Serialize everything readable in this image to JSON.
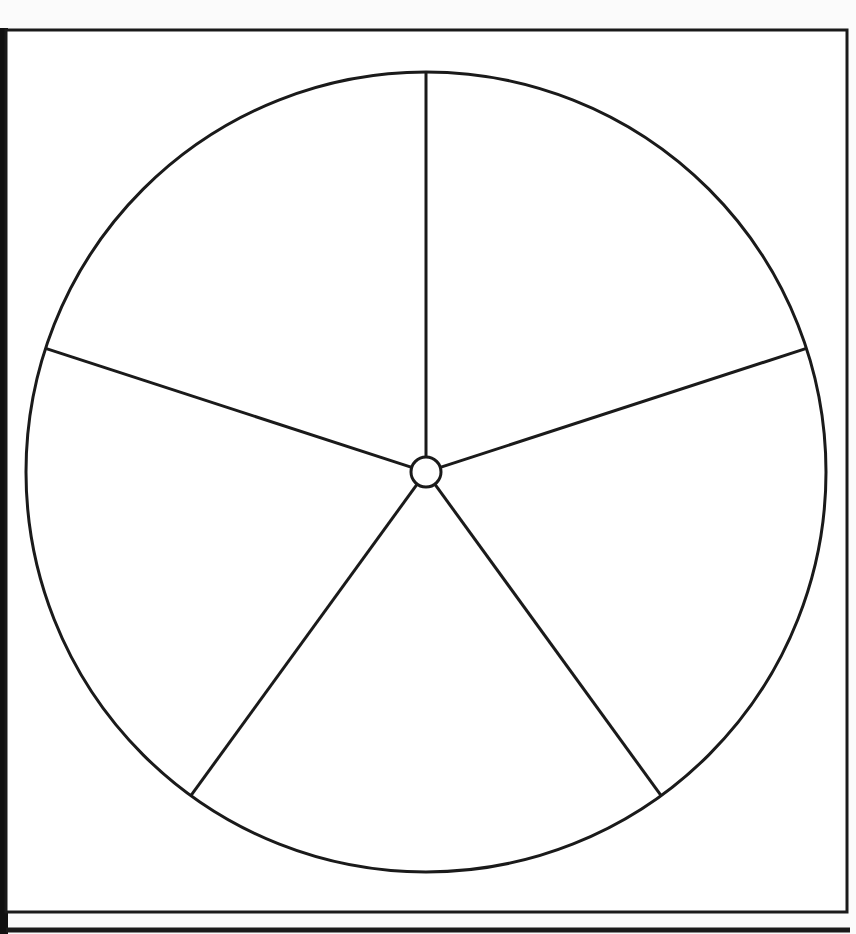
{
  "diagram": {
    "type": "segmented-circle",
    "segments": 5,
    "stroke_color": "#1a1a1a",
    "background": "#ffffff",
    "center": {
      "x": 426,
      "y": 472
    },
    "outer_radius": 400,
    "hub_radius": 15,
    "spoke_angles_deg": [
      -90,
      -18,
      54,
      126,
      198
    ]
  }
}
